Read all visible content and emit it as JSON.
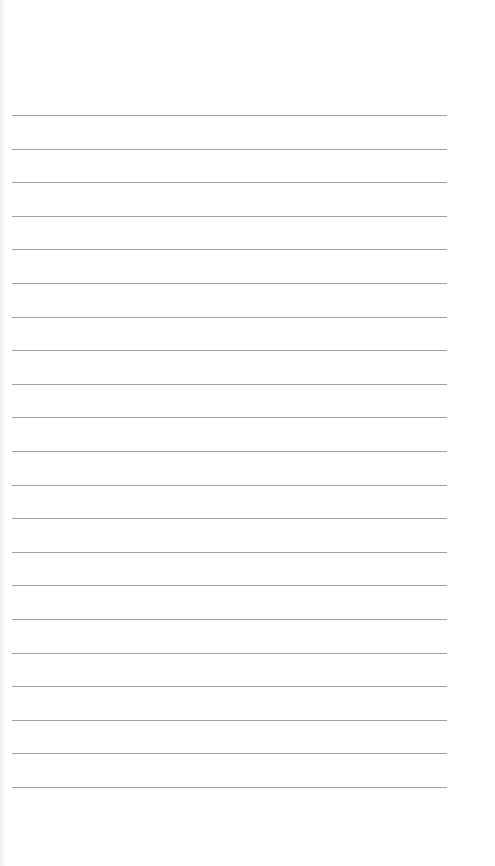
{
  "page": {
    "type": "lined-paper",
    "line_count": 21,
    "line_color": "#8f8f8f",
    "background_color": "#ffffff"
  }
}
